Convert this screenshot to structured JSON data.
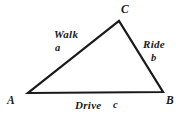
{
  "figure": {
    "type": "triangle-diagram",
    "background_color": "#ffffff",
    "stroke_color": "#1a1a1a",
    "stroke_width": 2.2
  },
  "vertices": [
    {
      "id": "A",
      "label": "A",
      "x": 28,
      "y": 93
    },
    {
      "id": "B",
      "label": "B",
      "x": 163,
      "y": 92
    },
    {
      "id": "C",
      "label": "C",
      "x": 119,
      "y": 21
    }
  ],
  "sides": [
    {
      "id": "AC",
      "name": "Walk",
      "variable": "a",
      "from": "A",
      "to": "C"
    },
    {
      "id": "CB",
      "name": "Ride",
      "variable": "b",
      "from": "C",
      "to": "B"
    },
    {
      "id": "AB",
      "name": "Drive",
      "variable": "c",
      "from": "A",
      "to": "B"
    }
  ]
}
